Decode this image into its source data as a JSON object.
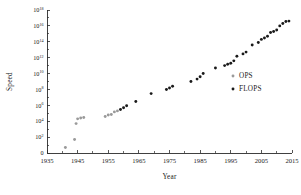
{
  "chart_data": {
    "type": "scatter",
    "title": "",
    "xlabel": "Year",
    "ylabel": "Speed",
    "xlim": [
      1935,
      2015
    ],
    "ylim_exponent": [
      0,
      18
    ],
    "yscale": "log",
    "grid": false,
    "legend_position": "right",
    "xticks": [
      1935,
      1945,
      1955,
      1965,
      1975,
      1985,
      1995,
      2005,
      2015
    ],
    "xminor_ticks": [
      1940,
      1950,
      1960,
      1970,
      1980,
      1990,
      2000,
      2010
    ],
    "ytick_labels": [
      "0",
      "10^2",
      "10^4",
      "10^6",
      "10^8",
      "10^10",
      "10^12",
      "10^14",
      "10^16",
      "10^18"
    ],
    "ytick_bases": [
      "0",
      "10",
      "10",
      "10",
      "10",
      "10",
      "10",
      "10",
      "10",
      "10"
    ],
    "ytick_exponents": [
      "",
      "2",
      "4",
      "6",
      "8",
      "10",
      "12",
      "14",
      "16",
      "18"
    ],
    "ytick_exponent_values": [
      0,
      2,
      4,
      6,
      8,
      10,
      12,
      14,
      16,
      18
    ],
    "series": [
      {
        "name": "OPS",
        "color": "#9a9a9a",
        "marker": "circle",
        "points": [
          [
            1941,
            5
          ],
          [
            1944,
            50
          ],
          [
            1944.5,
            5000
          ],
          [
            1945,
            20000
          ],
          [
            1946,
            25000
          ],
          [
            1947,
            30000
          ],
          [
            1954,
            40000
          ],
          [
            1955,
            60000
          ],
          [
            1956,
            70000
          ],
          [
            1957,
            150000
          ],
          [
            1958,
            200000
          ]
        ]
      },
      {
        "name": "FLOPS",
        "color": "#1a1a1a",
        "marker": "circle",
        "points": [
          [
            1959,
            300000
          ],
          [
            1960,
            500000
          ],
          [
            1961,
            900000
          ],
          [
            1964,
            3000000
          ],
          [
            1969,
            30000000
          ],
          [
            1974,
            100000000
          ],
          [
            1975,
            150000000
          ],
          [
            1976,
            250000000
          ],
          [
            1982,
            1000000000
          ],
          [
            1984,
            2000000000
          ],
          [
            1985,
            4000000000
          ],
          [
            1986,
            10000000000
          ],
          [
            1990,
            50000000000
          ],
          [
            1993,
            100000000000
          ],
          [
            1994,
            150000000000
          ],
          [
            1995,
            200000000000
          ],
          [
            1996,
            400000000000
          ],
          [
            1997,
            1500000000000
          ],
          [
            1999,
            3000000000000
          ],
          [
            2000,
            5000000000000
          ],
          [
            2002,
            40000000000000
          ],
          [
            2004,
            80000000000000
          ],
          [
            2005,
            200000000000000
          ],
          [
            2006,
            300000000000000
          ],
          [
            2007,
            500000000000000
          ],
          [
            2008,
            1500000000000000
          ],
          [
            2009,
            2000000000000000
          ],
          [
            2010,
            3000000000000000
          ],
          [
            2011,
            10000000000000000
          ],
          [
            2012,
            20000000000000000
          ],
          [
            2013,
            35000000000000000
          ],
          [
            2014,
            40000000000000000
          ]
        ]
      }
    ],
    "legend": [
      {
        "label": "OPS",
        "color": "#9a9a9a"
      },
      {
        "label": "FLOPS",
        "color": "#1a1a1a"
      }
    ]
  }
}
